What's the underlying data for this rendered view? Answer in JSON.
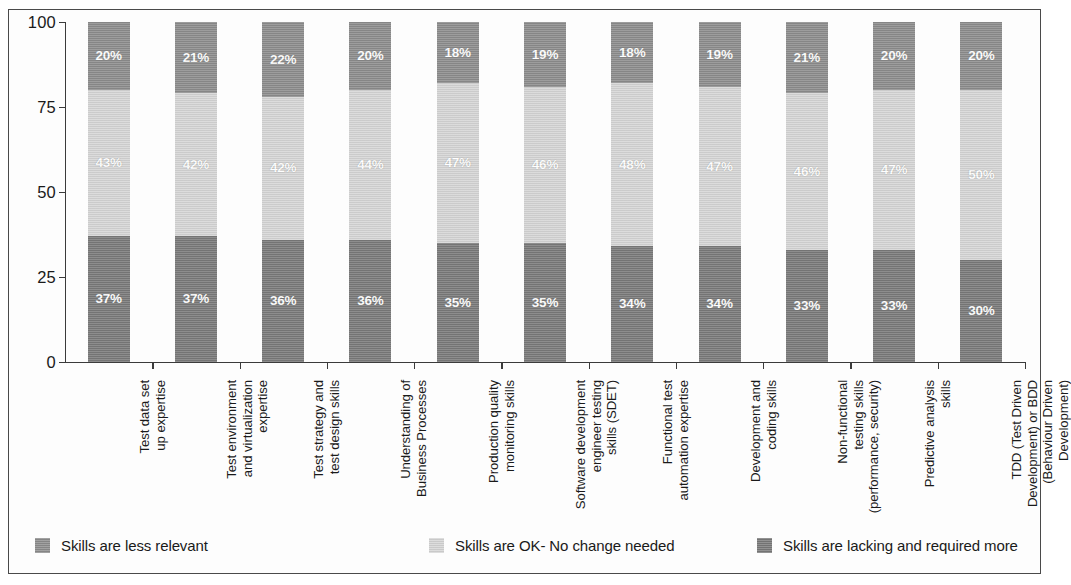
{
  "chart_data": {
    "type": "bar",
    "subtype": "stacked-bar-100-percent",
    "title": "",
    "xlabel": "",
    "ylabel": "",
    "ylim": [
      0,
      100
    ],
    "yticks": [
      0,
      25,
      50,
      75,
      100
    ],
    "ytick_labels": [
      "0",
      "25",
      "50",
      "75",
      "100"
    ],
    "grid": false,
    "legend_position": "bottom",
    "categories": [
      "Test data set\nup expertise",
      "Test environment\nand virtualization\nexpertise",
      "Test strategy and\ntest design skills",
      "Understanding of\nBusiness Processes",
      "Production quality\nmonitoring skills",
      "Software development\nengineer testing\nskills (SDET)",
      "Functional test\nautomation expertise",
      "Development and\ncoding skills",
      "Non-functional\ntesting skills\n(performance, security)",
      "Predictive analysis\nskills",
      "TDD (Test Driven\nDevelopment) or BDD\n(Behaviour Driven\nDevelopment)"
    ],
    "series": [
      {
        "name": "Skills are lacking and required more",
        "color": "#7a7a7a",
        "values": [
          37,
          37,
          36,
          36,
          35,
          35,
          34,
          34,
          33,
          33,
          30
        ],
        "labels": [
          "37%",
          "37%",
          "36%",
          "36%",
          "35%",
          "35%",
          "34%",
          "34%",
          "33%",
          "33%",
          "30%"
        ]
      },
      {
        "name": "Skills are OK- No change needed",
        "color": "#d6d6d6",
        "values": [
          43,
          42,
          42,
          44,
          47,
          46,
          48,
          47,
          46,
          47,
          50
        ],
        "labels": [
          "43%",
          "42%",
          "42%",
          "44%",
          "47%",
          "46%",
          "48%",
          "47%",
          "46%",
          "47%",
          "50%"
        ]
      },
      {
        "name": "Skills are less relevant",
        "color": "#8d8d8d",
        "values": [
          20,
          21,
          22,
          20,
          18,
          19,
          18,
          19,
          21,
          20,
          20
        ],
        "labels": [
          "20%",
          "21%",
          "22%",
          "20%",
          "18%",
          "19%",
          "18%",
          "19%",
          "21%",
          "20%",
          "20%"
        ]
      }
    ]
  },
  "legend": {
    "items": [
      {
        "label": "Skills are less relevant",
        "color": "#8d8d8d"
      },
      {
        "label": "Skills are OK- No change needed",
        "color": "#d6d6d6"
      },
      {
        "label": "Skills are lacking and required more",
        "color": "#7a7a7a"
      }
    ]
  }
}
